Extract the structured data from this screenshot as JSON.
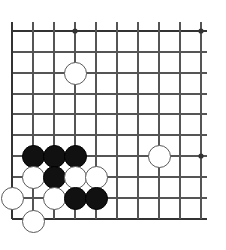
{
  "app": {
    "title": "Go Board Position",
    "board_color": "#ffffff",
    "line_color": "#555555",
    "edge_color": "#333333",
    "black_color": "#111111",
    "white_color": "#ffffff",
    "white_border_color": "#5a5a5a"
  },
  "board": {
    "name": "go-board",
    "view": "bottom-left corner partial view",
    "x_lines": [
      12,
      33,
      54,
      75,
      96,
      117,
      138,
      159,
      180,
      201
    ],
    "y_lines": [
      31,
      52,
      73,
      94,
      114,
      135,
      156,
      177,
      198,
      219
    ],
    "left_edge_x": 12,
    "top_edge_y": 31,
    "bottom_edge_y": 219,
    "right_extent_x": 207,
    "spacing": 21,
    "star_points": [
      {
        "x": 75,
        "y": 31
      },
      {
        "x": 201,
        "y": 31
      },
      {
        "x": 201,
        "y": 156
      }
    ],
    "stone_radius": 11.5
  },
  "stones": [
    {
      "color": "white",
      "x": 75,
      "y": 73,
      "label": "white-stone-top"
    },
    {
      "color": "white",
      "x": 159,
      "y": 156,
      "label": "white-stone-right"
    },
    {
      "color": "black",
      "x": 33,
      "y": 156,
      "label": "black-stone-a"
    },
    {
      "color": "black",
      "x": 54,
      "y": 156,
      "label": "black-stone-b"
    },
    {
      "color": "black",
      "x": 75,
      "y": 156,
      "label": "black-stone-c"
    },
    {
      "color": "white",
      "x": 33,
      "y": 177,
      "label": "white-stone-d"
    },
    {
      "color": "black",
      "x": 54,
      "y": 177,
      "label": "black-stone-e"
    },
    {
      "color": "white",
      "x": 75,
      "y": 177,
      "label": "white-stone-f"
    },
    {
      "color": "white",
      "x": 96,
      "y": 177,
      "label": "white-stone-g"
    },
    {
      "color": "white",
      "x": 12,
      "y": 198,
      "label": "white-stone-h"
    },
    {
      "color": "white",
      "x": 54,
      "y": 198,
      "label": "white-stone-i"
    },
    {
      "color": "black",
      "x": 75,
      "y": 198,
      "label": "black-stone-j"
    },
    {
      "color": "black",
      "x": 96,
      "y": 198,
      "label": "black-stone-k"
    },
    {
      "color": "white",
      "x": 33,
      "y": 221,
      "label": "white-stone-l"
    }
  ]
}
